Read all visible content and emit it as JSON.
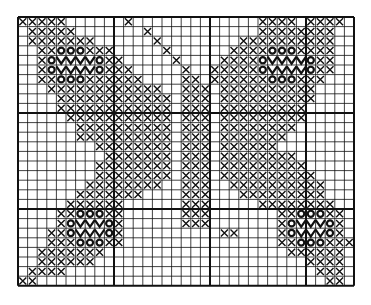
{
  "chart_title": "Butterfly cross-stitch chart",
  "grid": {
    "cols": 35,
    "rows": 28,
    "cell": 9.6,
    "major_every": 10,
    "line_color": "#111111",
    "ink_color": "#111111"
  },
  "legend": {
    ".": "empty",
    "x": "cross-stitch",
    "o": "circle-stitch",
    "v": "zigzag-stitch",
    "a": "antenna-cross"
  },
  "pattern": [
    "xxxxx......a.............xxxx.xxxx.",
    ".xxxxx.......a...........xxxxxxxx..",
    ".xxxxxxx......a........xxxxxxxxxx..",
    "..xxoooxxx.....a......xxxxoooxxxx..",
    "..xovvvvoxx.....a....xxxxovvvvoxx..",
    "..xovvvvoxxx.....a..xxxxxovvvvoxx..",
    "..xxoooxxxxxx....xx.xxxxxxoooxxx...",
    "...xxxxxxxxxxxx..xxx.xxxxxxxxxx....",
    "....xxxxxxxxxxxx.xxx.xxxxxxxxxx....",
    "....xxxxxxxxxxxx.xxx.xxxxxxxxx.....",
    ".....xxxxxxxxxxx.xxx.xxxxxxxxx.....",
    "......xxxxxxxxxx.xxx.xxxxxxxx......",
    "......xxxxxxxxxx.xxx.xxxxxxx.......",
    "........xxxxxxxx.xxx.xxxxxx........",
    ".........xxxxxxx.xxx.xxxxxxxx......",
    "........xxxxxxxx.xxx.xxxxxxxxx.....",
    "........xxxxxxxx.xxx.xxxxxxxxxx....",
    ".......xxxxxxxx..xxx..xxxxxxxxxx...",
    "......xxxxxxx....xxx...xxxxxxxxx...",
    ".....xxxxxx......xxx.....xxxxxxxx..",
    "....xxoooxx......xxx.......xxoooxx.",
    "....xovvvox......xxx.......xovvvox.",
    "...xxovvvox..........xx....xovvvox.",
    "...xxxoooxx................xxoooxxx",
    "..xxxxxxx...................xxxxxx.",
    "..xxxxxx......................xxxx.",
    ".xxxx..........................xxx.",
    "xx..............................xx."
  ]
}
